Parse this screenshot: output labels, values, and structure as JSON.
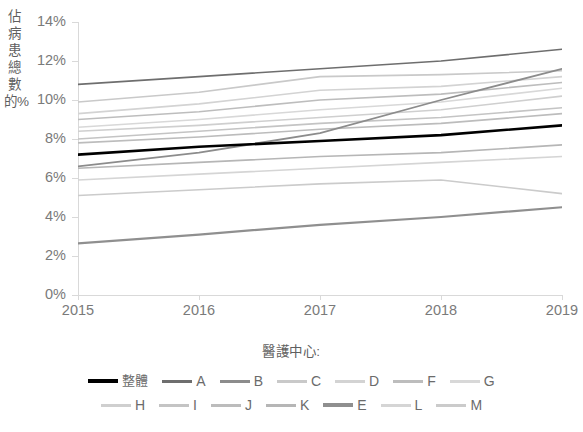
{
  "axes": {
    "y_title": "佔病患總數的%",
    "y_ticks": [
      "0%",
      "2%",
      "4%",
      "6%",
      "8%",
      "10%",
      "12%",
      "14%"
    ],
    "y_tick_values": [
      0,
      2,
      4,
      6,
      8,
      10,
      12,
      14
    ],
    "x_ticks": [
      "2015",
      "2016",
      "2017",
      "2018",
      "2019"
    ]
  },
  "legend": {
    "title": "醫護中心:",
    "row1": [
      {
        "label": "整體",
        "color": "#000000",
        "thick": true
      },
      {
        "label": "A",
        "color": "#6e6e6e",
        "thick": false
      },
      {
        "label": "B",
        "color": "#8c8c8c",
        "thick": false
      },
      {
        "label": "C",
        "color": "#c9c9c9",
        "thick": false
      },
      {
        "label": "D",
        "color": "#d3d3d3",
        "thick": false
      },
      {
        "label": "F",
        "color": "#bdbdbd",
        "thick": false
      },
      {
        "label": "G",
        "color": "#d8d8d8",
        "thick": false
      }
    ],
    "row2": [
      {
        "label": "H",
        "color": "#cfcfcf",
        "thick": false
      },
      {
        "label": "I",
        "color": "#c4c4c4",
        "thick": false
      },
      {
        "label": "J",
        "color": "#bcbcbc",
        "thick": false
      },
      {
        "label": "K",
        "color": "#b6b6b6",
        "thick": false
      },
      {
        "label": "E",
        "color": "#8f8f8f",
        "thick": true
      },
      {
        "label": "L",
        "color": "#d5d5d5",
        "thick": false
      },
      {
        "label": "M",
        "color": "#cbcbcb",
        "thick": false
      }
    ]
  },
  "chart_data": {
    "type": "line",
    "title": "",
    "xlabel": "",
    "ylabel": "佔病患總數的%",
    "x": [
      "2015",
      "2016",
      "2017",
      "2018",
      "2019"
    ],
    "ylim": [
      0,
      14
    ],
    "xlim": [
      "2015",
      "2019"
    ],
    "grid": false,
    "legend_position": "bottom",
    "legend_title": "醫護中心:",
    "series": [
      {
        "name": "整體",
        "color": "#000000",
        "width": 2.6,
        "values": [
          7.2,
          7.6,
          7.9,
          8.2,
          8.7
        ]
      },
      {
        "name": "A",
        "color": "#6e6e6e",
        "width": 1.6,
        "values": [
          10.8,
          11.2,
          11.6,
          12.0,
          12.6
        ]
      },
      {
        "name": "B",
        "color": "#8c8c8c",
        "width": 1.8,
        "values": [
          6.6,
          7.3,
          8.3,
          10.0,
          11.6
        ]
      },
      {
        "name": "C",
        "color": "#c9c9c9",
        "width": 1.6,
        "values": [
          9.9,
          10.4,
          11.2,
          11.3,
          11.5
        ]
      },
      {
        "name": "D",
        "color": "#d3d3d3",
        "width": 1.6,
        "values": [
          9.3,
          9.8,
          10.5,
          10.7,
          11.2
        ]
      },
      {
        "name": "F",
        "color": "#bdbdbd",
        "width": 1.6,
        "values": [
          9.0,
          9.4,
          10.0,
          10.3,
          10.9
        ]
      },
      {
        "name": "G",
        "color": "#d8d8d8",
        "width": 1.6,
        "values": [
          8.6,
          9.0,
          9.5,
          9.9,
          10.6
        ]
      },
      {
        "name": "H",
        "color": "#cfcfcf",
        "width": 1.6,
        "values": [
          8.4,
          8.7,
          9.1,
          9.5,
          10.2
        ]
      },
      {
        "name": "I",
        "color": "#c4c4c4",
        "width": 1.6,
        "values": [
          8.0,
          8.4,
          8.8,
          9.1,
          9.6
        ]
      },
      {
        "name": "J",
        "color": "#bcbcbc",
        "width": 1.6,
        "values": [
          7.8,
          8.1,
          8.5,
          8.8,
          9.3
        ]
      },
      {
        "name": "K",
        "color": "#b6b6b6",
        "width": 1.6,
        "values": [
          6.5,
          6.8,
          7.1,
          7.3,
          7.7
        ]
      },
      {
        "name": "E",
        "color": "#8f8f8f",
        "width": 2.2,
        "values": [
          2.65,
          3.1,
          3.6,
          4.0,
          4.5
        ]
      },
      {
        "name": "L",
        "color": "#d5d5d5",
        "width": 1.6,
        "values": [
          5.9,
          6.2,
          6.5,
          6.8,
          7.1
        ]
      },
      {
        "name": "M",
        "color": "#cbcbcb",
        "width": 1.6,
        "values": [
          5.1,
          5.4,
          5.7,
          5.9,
          5.2
        ]
      }
    ]
  }
}
